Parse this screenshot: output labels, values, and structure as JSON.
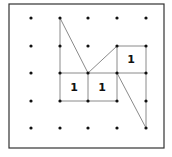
{
  "diagram": {
    "type": "geoboard",
    "grid": {
      "cols": 5,
      "rows": 5,
      "x": [
        31,
        60,
        88,
        117,
        146
      ],
      "y": [
        18,
        46,
        73,
        101,
        128
      ]
    },
    "frame": {
      "x": 9,
      "y": 4,
      "w": 155,
      "h": 144
    },
    "colors": {
      "frame": "#333333",
      "line": "#8a8a8a",
      "dot": "#111111"
    },
    "segments": [
      [
        [
          1,
          0
        ],
        [
          1,
          3
        ]
      ],
      [
        [
          1,
          0
        ],
        [
          2,
          2
        ]
      ],
      [
        [
          2,
          2
        ],
        [
          3,
          1
        ]
      ],
      [
        [
          3,
          1
        ],
        [
          4,
          1
        ]
      ],
      [
        [
          4,
          1
        ],
        [
          4,
          4
        ]
      ],
      [
        [
          3,
          1
        ],
        [
          3,
          3
        ]
      ],
      [
        [
          1,
          2
        ],
        [
          4,
          2
        ]
      ],
      [
        [
          1,
          3
        ],
        [
          3,
          3
        ]
      ],
      [
        [
          2,
          2
        ],
        [
          2,
          3
        ]
      ],
      [
        [
          3,
          2
        ],
        [
          4,
          4
        ]
      ]
    ],
    "labels": [
      {
        "text": "1",
        "cx": 74,
        "cy": 87
      },
      {
        "text": "1",
        "cx": 102,
        "cy": 87
      },
      {
        "text": "1",
        "cx": 131,
        "cy": 59
      }
    ]
  }
}
